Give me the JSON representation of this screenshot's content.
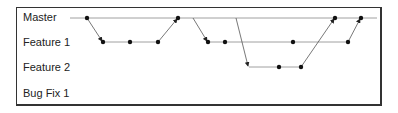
{
  "diagram": {
    "type": "git-branching",
    "branches": [
      {
        "name": "Master",
        "y": 18
      },
      {
        "name": "Feature 1",
        "y": 42
      },
      {
        "name": "Feature 2",
        "y": 67
      },
      {
        "name": "Bug Fix 1",
        "y": 92
      }
    ],
    "master_line": {
      "x1": 70,
      "x2": 377
    },
    "feature1_line": {
      "x1": 103,
      "x2": 158,
      "x3": 208,
      "x4": 348
    },
    "feature2_line": {
      "x1": 249,
      "x2": 301
    },
    "commits": [
      {
        "branch": "Master",
        "x": 87
      },
      {
        "branch": "Feature 1",
        "x": 103
      },
      {
        "branch": "Feature 1",
        "x": 130
      },
      {
        "branch": "Feature 1",
        "x": 158
      },
      {
        "branch": "Master",
        "x": 178
      },
      {
        "branch": "Feature 1",
        "x": 208
      },
      {
        "branch": "Feature 1",
        "x": 225
      },
      {
        "branch": "Feature 2",
        "x": 279
      },
      {
        "branch": "Feature 2",
        "x": 301
      },
      {
        "branch": "Feature 1",
        "x": 293
      },
      {
        "branch": "Feature 1",
        "x": 348
      },
      {
        "branch": "Master",
        "x": 335
      },
      {
        "branch": "Master",
        "x": 361
      }
    ],
    "arrows": [
      {
        "from": "Master@87",
        "to": "Feature 1@103"
      },
      {
        "from": "Feature 1@158",
        "to": "Master@178"
      },
      {
        "from": "Master@193",
        "to": "Feature 1@208"
      },
      {
        "from": "Master@236",
        "to": "Feature 2@249"
      },
      {
        "from": "Feature 2@301",
        "to": "Master@335"
      },
      {
        "from": "Feature 1@348",
        "to": "Master@361"
      }
    ]
  }
}
